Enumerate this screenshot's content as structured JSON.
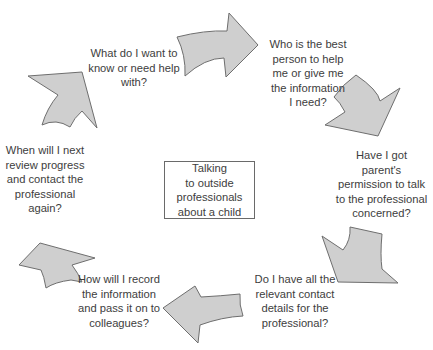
{
  "diagram": {
    "title": "Talking to outside professionals about a child",
    "center": {
      "text": "Talking\nto outside\nprofessionals\nabout a child"
    },
    "steps": [
      {
        "id": "step-1",
        "text": "What do I want to\nknow or need help\nwith?"
      },
      {
        "id": "step-2",
        "text": "Who is the best\nperson to help\nme or give me\nthe information\nI need?"
      },
      {
        "id": "step-3",
        "text": "Have I got\nparent's\npermission to talk\nto the professional\nconcerned?"
      },
      {
        "id": "step-4",
        "text": "Do I have all the\nrelevant contact\ndetails for the\nprofessional?"
      },
      {
        "id": "step-5",
        "text": "How will I record\nthe information\nand pass it on to\ncolleagues?"
      },
      {
        "id": "step-6",
        "text": "When will I next\nreview progress\nand contact the\nprofessional\nagain?"
      }
    ],
    "arrows": [
      {
        "id": "arrow-top",
        "direction": "right"
      },
      {
        "id": "arrow-upper-right",
        "direction": "down-right"
      },
      {
        "id": "arrow-lower-right",
        "direction": "down-left"
      },
      {
        "id": "arrow-bottom",
        "direction": "left"
      },
      {
        "id": "arrow-lower-left",
        "direction": "up-left"
      },
      {
        "id": "arrow-upper-left",
        "direction": "up-right"
      }
    ],
    "colors": {
      "arrow_fill": "#cfcfcf",
      "arrow_stroke": "#6e6e6e",
      "text": "#3d3d3d",
      "box_border": "#6a6a6a",
      "background": "#ffffff"
    }
  }
}
